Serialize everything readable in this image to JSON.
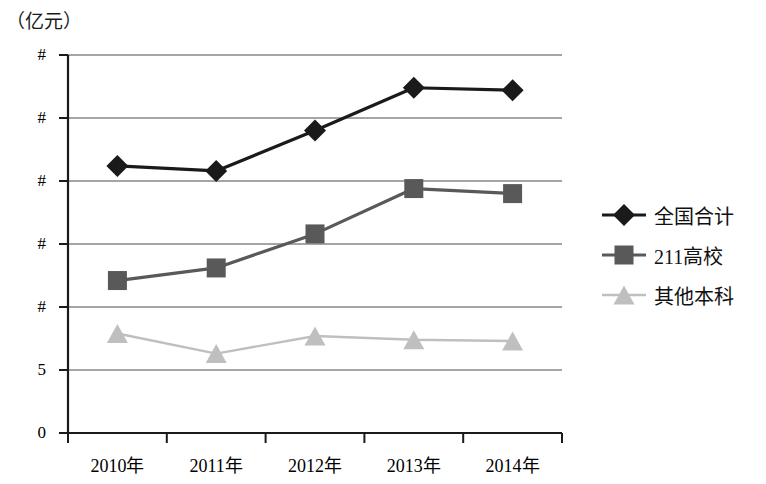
{
  "axis_unit_label": "（亿元）",
  "chart_data": {
    "type": "line",
    "title": "",
    "subtitle": "",
    "xlabel": "",
    "ylabel": "（亿元）",
    "unit": "亿元",
    "categories": [
      "2010年",
      "2011年",
      "2012年",
      "2013年",
      "2014年"
    ],
    "ytick_labels": [
      "#",
      "#",
      "#",
      "#",
      "#",
      "5",
      "0"
    ],
    "ytick_values": [
      30,
      25,
      20,
      15,
      10,
      5,
      0
    ],
    "ylim": [
      0,
      30
    ],
    "grid": true,
    "legend_position": "right",
    "series": [
      {
        "name": "全国合计",
        "marker": "diamond",
        "color": "#1a1a1a",
        "values": [
          21.2,
          20.8,
          24.0,
          27.4,
          27.2
        ]
      },
      {
        "name": "211高校",
        "marker": "square",
        "color": "#595959",
        "values": [
          12.1,
          13.1,
          15.8,
          19.4,
          19.0
        ]
      },
      {
        "name": "其他本科",
        "marker": "triangle",
        "color": "#bfbfbf",
        "values": [
          7.9,
          6.3,
          7.7,
          7.4,
          7.3
        ]
      }
    ]
  }
}
